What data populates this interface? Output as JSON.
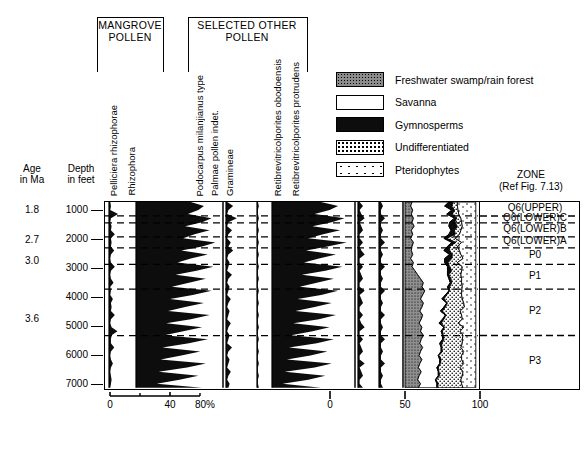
{
  "figure": {
    "groups": [
      {
        "id": "mangrove",
        "label": "MANGROVE\nPOLLEN",
        "label_line1": "MANGROVE",
        "label_line2": "POLLEN"
      },
      {
        "id": "other",
        "label": "SELECTED OTHER POLLEN",
        "label_line1": "SELECTED OTHER",
        "label_line2": "POLLEN"
      }
    ],
    "axes": {
      "age": {
        "header_line1": "Age",
        "header_line2": "in Ma",
        "values": [
          "1.8",
          "2.7",
          "3.0",
          "3.6"
        ]
      },
      "depth": {
        "header_line1": "Depth",
        "header_line2": "in feet",
        "ticks": [
          "1000",
          "2000",
          "3000",
          "4000",
          "5000",
          "6000",
          "7000"
        ]
      },
      "pollen_scale": {
        "ticks": [
          "0",
          "40",
          "80%"
        ]
      },
      "percent_scale": {
        "ticks": [
          "0",
          "50",
          "100"
        ]
      }
    },
    "zone": {
      "header_line1": "ZONE",
      "header_line2": "(Ref Fig. 7.13)",
      "names": [
        "Q6(UPPER)",
        "Q6(LOWER)C",
        "Q6(LOWER)B",
        "Q6(LOWER)A",
        "P0",
        "P1",
        "P2",
        "P3"
      ]
    },
    "legend": {
      "items": [
        {
          "label": "Freshwater swamp/rain forest",
          "pattern": "fresh",
          "color": "#8c8c8c"
        },
        {
          "label": "Savanna",
          "pattern": "sav",
          "color": "#ffffff"
        },
        {
          "label": "Gymnosperms",
          "pattern": "gym",
          "color": "#0d0d0d"
        },
        {
          "label": "Undifferentiated",
          "pattern": "undiff",
          "color": "#ffffff"
        },
        {
          "label": "Pteridophytes",
          "pattern": "pter",
          "color": "#ffffff"
        }
      ]
    },
    "taxa": [
      {
        "name": "Pelliciera rhizophorae",
        "group": "mangrove"
      },
      {
        "name": "Rhizophora",
        "group": "mangrove"
      },
      {
        "name": "Podocarpus milanjianus type",
        "group": "other"
      },
      {
        "name": "Palmae pollen indet.",
        "group": "other"
      },
      {
        "name": "Gramineae",
        "group": "other"
      },
      {
        "name": "Retibrevitricolporites obodoensis",
        "group": "other"
      },
      {
        "name": "Retibrevitricolporites protrudens",
        "group": "other"
      }
    ]
  },
  "chart_data": {
    "type": "area",
    "title": "",
    "xlabel": "",
    "ylabel": "Depth in feet",
    "ylim": [
      700,
      7100
    ],
    "grid": false,
    "legend_position": "top-right",
    "depth_axis_ticks": [
      1000,
      2000,
      3000,
      4000,
      5000,
      6000,
      7000
    ],
    "age_tie_points": [
      {
        "age_ma": 1.8,
        "depth_ft": 1000
      },
      {
        "age_ma": 2.7,
        "depth_ft": 2050
      },
      {
        "age_ma": 3.0,
        "depth_ft": 2750
      },
      {
        "age_ma": 3.6,
        "depth_ft": 4750
      }
    ],
    "zone_boundaries_ft": [
      700,
      1180,
      1420,
      1900,
      2280,
      2850,
      3700,
      5300,
      7100
    ],
    "zones": [
      {
        "name": "Q6(UPPER)",
        "top_ft": 700,
        "base_ft": 1180
      },
      {
        "name": "Q6(LOWER)C",
        "top_ft": 1180,
        "base_ft": 1420
      },
      {
        "name": "Q6(LOWER)B",
        "top_ft": 1420,
        "base_ft": 1900
      },
      {
        "name": "Q6(LOWER)A",
        "top_ft": 1900,
        "base_ft": 2280
      },
      {
        "name": "P0",
        "top_ft": 2280,
        "base_ft": 2850
      },
      {
        "name": "P1",
        "top_ft": 2850,
        "base_ft": 3700
      },
      {
        "name": "P2",
        "top_ft": 3700,
        "base_ft": 5300
      },
      {
        "name": "P3",
        "top_ft": 5300,
        "base_ft": 7100
      }
    ],
    "pollen_curves": [
      {
        "name": "Pelliciera rhizophorae",
        "xmax_pct": 40,
        "values_pct": [
          2,
          3,
          2,
          14,
          3,
          2,
          4,
          3,
          9,
          3,
          4,
          3,
          8,
          3,
          2,
          3,
          9,
          3,
          2,
          3,
          7,
          2,
          3,
          2,
          6,
          3,
          4,
          3,
          9,
          3,
          2,
          4,
          13,
          4,
          3,
          3,
          8,
          3,
          2,
          3,
          6,
          3,
          2,
          3,
          4,
          3,
          2
        ]
      },
      {
        "name": "Rhizophora",
        "xmax_pct": 90,
        "values_pct": [
          58,
          72,
          66,
          55,
          80,
          70,
          52,
          78,
          62,
          50,
          84,
          70,
          48,
          76,
          58,
          44,
          82,
          64,
          42,
          74,
          56,
          38,
          80,
          60,
          36,
          72,
          52,
          34,
          78,
          58,
          32,
          70,
          50,
          30,
          76,
          56,
          28,
          68,
          48,
          26,
          74,
          54,
          24,
          66,
          46,
          22,
          70
        ]
      },
      {
        "name": "Podocarpus milanjianus type",
        "xmax_pct": 25,
        "values_pct": [
          1,
          6,
          2,
          1,
          9,
          2,
          1,
          5,
          2,
          1,
          4,
          2,
          6,
          2,
          1,
          3,
          2,
          1,
          5,
          2,
          1,
          3,
          2,
          1,
          4,
          2,
          1,
          3,
          2,
          1,
          4,
          2,
          1,
          3,
          2,
          1,
          5,
          2,
          1,
          3,
          2,
          1,
          4,
          2,
          1,
          3,
          2
        ]
      },
      {
        "name": "Palmae pollen indet.",
        "xmax_pct": 15,
        "values_pct": [
          1,
          2,
          1,
          1,
          2,
          1,
          1,
          2,
          1,
          1,
          2,
          1,
          1,
          2,
          1,
          1,
          2,
          1,
          1,
          2,
          1,
          1,
          2,
          1,
          1,
          2,
          1,
          1,
          2,
          1,
          1,
          2,
          1,
          1,
          2,
          1,
          1,
          2,
          1,
          1,
          2,
          1,
          1,
          2,
          1,
          1,
          2
        ]
      },
      {
        "name": "Gramineae",
        "xmax_pct": 75,
        "values_pct": [
          46,
          62,
          54,
          40,
          68,
          56,
          38,
          64,
          48,
          34,
          70,
          52,
          32,
          60,
          44,
          30,
          66,
          50,
          28,
          58,
          42,
          26,
          62,
          46,
          24,
          56,
          40,
          22,
          60,
          44,
          20,
          54,
          38,
          18,
          58,
          42,
          16,
          52,
          36,
          14,
          56,
          40,
          12,
          50,
          34,
          10,
          46
        ]
      },
      {
        "name": "Retibrevitricolporites obodoensis",
        "xmax_pct": 12,
        "values_pct": [
          1,
          3,
          1,
          2,
          4,
          1,
          2,
          3,
          1,
          1,
          3,
          1,
          2,
          4,
          1,
          1,
          3,
          1,
          2,
          3,
          1,
          1,
          4,
          1,
          2,
          3,
          1,
          1,
          3,
          1,
          2,
          4,
          1,
          1,
          3,
          1,
          2,
          3,
          1,
          1,
          4,
          1,
          2,
          3,
          1,
          1,
          3
        ]
      },
      {
        "name": "Retibrevitricolporites protrudens",
        "xmax_pct": 10,
        "values_pct": [
          1,
          2,
          1,
          1,
          3,
          1,
          1,
          2,
          1,
          1,
          3,
          1,
          1,
          2,
          1,
          1,
          3,
          1,
          1,
          2,
          1,
          1,
          3,
          1,
          1,
          2,
          1,
          1,
          3,
          1,
          1,
          2,
          1,
          1,
          3,
          1,
          1,
          2,
          1,
          1,
          3,
          1,
          1,
          2,
          1,
          1,
          2
        ]
      }
    ],
    "cumulative_series": [
      {
        "name": "Freshwater swamp/rain forest",
        "pattern": "fresh",
        "values_pct": [
          10,
          8,
          11,
          9,
          12,
          10,
          13,
          9,
          11,
          8,
          12,
          10,
          9,
          11,
          8,
          12,
          10,
          14,
          18,
          22,
          26,
          24,
          28,
          25,
          22,
          26,
          24,
          21,
          25,
          23,
          20,
          24,
          22,
          26,
          23,
          21,
          25,
          22,
          20,
          24,
          21,
          19,
          23,
          20,
          18,
          22,
          19
        ]
      },
      {
        "name": "Savanna",
        "pattern": "sav",
        "values_pct": [
          52,
          48,
          55,
          50,
          58,
          53,
          49,
          56,
          51,
          47,
          54,
          50,
          46,
          52,
          48,
          44,
          50,
          46,
          42,
          40,
          38,
          36,
          34,
          32,
          30,
          33,
          31,
          29,
          32,
          30,
          28,
          31,
          29,
          27,
          30,
          28,
          26,
          29,
          27,
          25,
          28,
          26,
          24,
          27,
          25,
          23,
          26
        ]
      },
      {
        "name": "Gymnosperms",
        "pattern": "gym",
        "values_pct": [
          6,
          10,
          4,
          8,
          3,
          7,
          12,
          5,
          9,
          4,
          6,
          3,
          8,
          4,
          10,
          5,
          3,
          6,
          2,
          3,
          2,
          3,
          1,
          2,
          3,
          1,
          2,
          3,
          1,
          2,
          3,
          1,
          2,
          1,
          2,
          3,
          1,
          2,
          1,
          2,
          1,
          2,
          1,
          2,
          1,
          2,
          1
        ]
      },
      {
        "name": "Undifferentiated",
        "pattern": "undiff",
        "values_pct": [
          6,
          8,
          5,
          9,
          6,
          10,
          7,
          9,
          6,
          12,
          8,
          11,
          14,
          12,
          16,
          13,
          18,
          14,
          17,
          15,
          14,
          18,
          17,
          21,
          26,
          23,
          27,
          25,
          22,
          26,
          24,
          27,
          25,
          28,
          26,
          29,
          27,
          30,
          32,
          29,
          33,
          31,
          34,
          32,
          35,
          33,
          36
        ]
      },
      {
        "name": "Pteridophytes",
        "pattern": "pter",
        "values_pct": [
          26,
          26,
          25,
          24,
          21,
          20,
          19,
          21,
          23,
          29,
          20,
          26,
          23,
          21,
          18,
          26,
          19,
          20,
          21,
          20,
          20,
          19,
          20,
          20,
          19,
          17,
          16,
          22,
          20,
          19,
          25,
          17,
          22,
          18,
          19,
          19,
          21,
          17,
          20,
          20,
          17,
          22,
          18,
          19,
          21,
          20,
          18
        ]
      }
    ]
  }
}
